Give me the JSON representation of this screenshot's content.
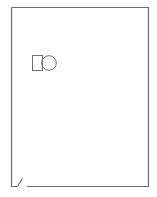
{
  "diagram": {
    "type": "page-outline",
    "page": {
      "stroke": "#6e6e6e",
      "fill": "#ffffff",
      "corner": "folded-bottom-left"
    },
    "shapes": [
      {
        "kind": "square",
        "label": "square-shape"
      },
      {
        "kind": "circle",
        "label": "circle-shape"
      }
    ],
    "faint_text": ""
  }
}
